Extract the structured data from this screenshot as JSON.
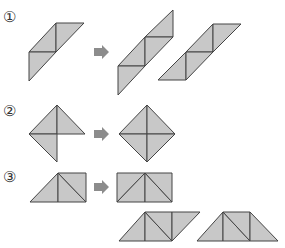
{
  "header": {
    "clipped_text": ""
  },
  "colors": {
    "fill": "#c8c8c8",
    "stroke": "#444444",
    "arrow": "#8c8c8c"
  },
  "sections": [
    {
      "label": "①"
    },
    {
      "label": "②"
    },
    {
      "label": "③"
    }
  ],
  "icons": {
    "arrow": "right-arrow-icon"
  }
}
